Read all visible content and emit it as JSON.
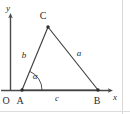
{
  "figure": {
    "type": "geometry-diagram",
    "colors": {
      "stroke": "#3a3a3a",
      "axis": "#4a4a4a",
      "label": "#2b2b2b",
      "border": "#cfcfcf",
      "background": "#ffffff"
    },
    "axes": {
      "x_label": "x",
      "y_label": "y",
      "origin_label": "O"
    },
    "vertices": {
      "a": {
        "label": "A",
        "x": 22,
        "y": 90
      },
      "b": {
        "label": "B",
        "x": 98,
        "y": 90
      },
      "c": {
        "label": "C",
        "x": 48,
        "y": 27
      }
    },
    "sides": {
      "a": {
        "label": "a",
        "from": "B",
        "to": "C"
      },
      "b": {
        "label": "b",
        "from": "A",
        "to": "C"
      },
      "c": {
        "label": "c",
        "from": "A",
        "to": "B"
      }
    },
    "angle": {
      "label": "α",
      "at_vertex": "A"
    }
  }
}
